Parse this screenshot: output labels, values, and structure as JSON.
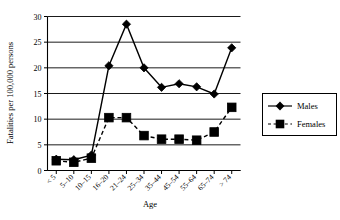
{
  "chart_data": {
    "type": "line",
    "title": "",
    "xlabel": "Age",
    "ylabel": "Fatalities per 100,000 persons",
    "categories": [
      "< 5",
      "5–10",
      "10–15",
      "16–20",
      "21–24",
      "25–34",
      "35–44",
      "45–54",
      "55–64",
      "65–74",
      "> 74"
    ],
    "ylim": [
      0,
      30
    ],
    "yticks": [
      0,
      5,
      10,
      15,
      20,
      25,
      30
    ],
    "grid": "horizontal",
    "legend_position": "right",
    "series": [
      {
        "name": "Males",
        "marker": "diamond",
        "line_style": "solid",
        "color": "#000000",
        "values": [
          2.2,
          2.1,
          3.0,
          20.4,
          28.5,
          20.0,
          16.2,
          16.9,
          16.3,
          14.9,
          23.9
        ]
      },
      {
        "name": "Females",
        "marker": "square",
        "line_style": "dashed",
        "color": "#000000",
        "values": [
          1.9,
          1.6,
          2.4,
          10.3,
          10.3,
          6.8,
          6.1,
          6.1,
          5.9,
          7.5,
          12.3
        ]
      }
    ]
  },
  "legend": {
    "entries": [
      {
        "label": "Males"
      },
      {
        "label": "Females"
      }
    ]
  },
  "axes": {
    "y_title": "Fatalities per 100,000 persons",
    "x_title": "Age",
    "y_tick_labels": [
      "0",
      "5",
      "10",
      "15",
      "20",
      "25",
      "30"
    ],
    "x_tick_labels": [
      "< 5",
      "5–10",
      "10–15",
      "16–20",
      "21–24",
      "25–34",
      "35–44",
      "45–54",
      "55–64",
      "65–74",
      "> 74"
    ]
  }
}
